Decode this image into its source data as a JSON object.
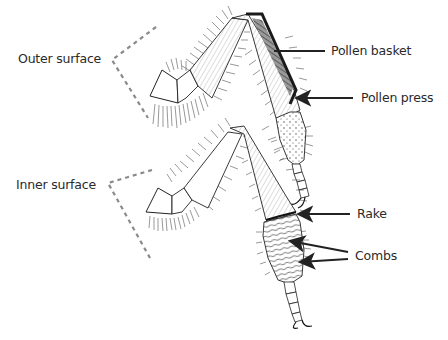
{
  "diagram": {
    "views": [
      {
        "id": "outer",
        "label": "Outer surface"
      },
      {
        "id": "inner",
        "label": "Inner surface"
      }
    ],
    "callouts": [
      {
        "id": "pollen-basket",
        "label": "Pollen basket",
        "view": "outer"
      },
      {
        "id": "pollen-press",
        "label": "Pollen press",
        "view": "outer"
      },
      {
        "id": "rake",
        "label": "Rake",
        "view": "inner"
      },
      {
        "id": "combs",
        "label": "Combs",
        "view": "inner"
      }
    ],
    "colors": {
      "background": "#ffffff",
      "ink": "#1a1a1a",
      "label_text": "#2a2a2a",
      "dashed_bracket": "#8a8a8a",
      "arrow": "#222222"
    }
  }
}
